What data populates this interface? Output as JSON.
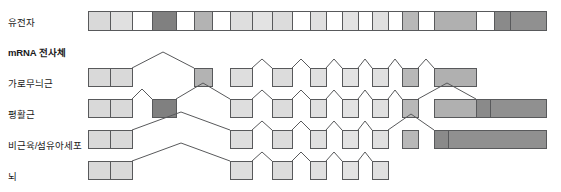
{
  "figure": {
    "title": "",
    "type": "gene-alternative-splicing-diagram",
    "width": 561,
    "height": 192,
    "background": "#ffffff",
    "stroke_color": "#58595b",
    "colors": {
      "light_gray": "#d9d9d9",
      "mid_gray": "#b3b3b3",
      "dark_gray": "#808080",
      "darker_gray": "#6e6e6e",
      "white": "#ffffff",
      "outline": "#58595b",
      "text": "#1a1a1a"
    }
  },
  "labels": [
    {
      "id": "gene",
      "text": "유전자",
      "bold": false,
      "x": 8,
      "y": 18
    },
    {
      "id": "mrna",
      "text": "mRNA 전사체",
      "bold": true,
      "x": 8,
      "y": 48
    },
    {
      "id": "striated",
      "text": "가로무늬근",
      "bold": false,
      "x": 8,
      "y": 79
    },
    {
      "id": "smooth",
      "text": "평활근",
      "bold": false,
      "x": 8,
      "y": 110
    },
    {
      "id": "nonmuscle",
      "text": "비근육/섬유아세포",
      "bold": false,
      "x": 8,
      "y": 141
    },
    {
      "id": "brain",
      "text": "뇌",
      "bold": false,
      "x": 8,
      "y": 172
    }
  ],
  "chart_data": {
    "type": "diagram",
    "xlabel": "",
    "ylabel": "",
    "legend": [],
    "gene_track": {
      "name": "유전자",
      "x_start": 88,
      "x_end": 546,
      "y": 11,
      "height": 19,
      "segments": [
        {
          "index": 1,
          "x": 88,
          "w": 22,
          "fill": "#d9d9d9"
        },
        {
          "index": 2,
          "x": 110,
          "w": 22,
          "fill": "#e0e0e0"
        },
        {
          "index": 3,
          "x": 132,
          "w": 20,
          "fill": "#ffffff"
        },
        {
          "index": 4,
          "x": 152,
          "w": 24,
          "fill": "#808080"
        },
        {
          "index": 5,
          "x": 176,
          "w": 18,
          "fill": "#ffffff"
        },
        {
          "index": 6,
          "x": 194,
          "w": 18,
          "fill": "#b3b3b3"
        },
        {
          "index": 7,
          "x": 212,
          "w": 18,
          "fill": "#ffffff"
        },
        {
          "index": 8,
          "x": 230,
          "w": 22,
          "fill": "#dedede"
        },
        {
          "index": 9,
          "x": 252,
          "w": 20,
          "fill": "#e3e3e3"
        },
        {
          "index": 10,
          "x": 272,
          "w": 20,
          "fill": "#dcdcdc"
        },
        {
          "index": 11,
          "x": 292,
          "w": 18,
          "fill": "#ffffff"
        },
        {
          "index": 12,
          "x": 310,
          "w": 16,
          "fill": "#e0e0e0"
        },
        {
          "index": 13,
          "x": 326,
          "w": 16,
          "fill": "#ffffff"
        },
        {
          "index": 14,
          "x": 342,
          "w": 16,
          "fill": "#e3e3e3"
        },
        {
          "index": 15,
          "x": 358,
          "w": 14,
          "fill": "#ffffff"
        },
        {
          "index": 16,
          "x": 372,
          "w": 16,
          "fill": "#e0e0e0"
        },
        {
          "index": 17,
          "x": 388,
          "w": 14,
          "fill": "#ffffff"
        },
        {
          "index": 18,
          "x": 402,
          "w": 16,
          "fill": "#b8b8b8"
        },
        {
          "index": 19,
          "x": 418,
          "w": 16,
          "fill": "#ffffff"
        },
        {
          "index": 20,
          "x": 434,
          "w": 42,
          "fill": "#b0b0b0"
        },
        {
          "index": 21,
          "x": 476,
          "w": 18,
          "fill": "#ffffff"
        },
        {
          "index": 22,
          "x": 494,
          "w": 16,
          "fill": "#8a8a8a"
        },
        {
          "index": 23,
          "x": 510,
          "w": 36,
          "fill": "#909090"
        }
      ]
    },
    "transcripts": [
      {
        "name": "가로무늬근",
        "baseline_y": 86,
        "box_height": 18,
        "exons": [
          {
            "x": 88,
            "w": 22,
            "fill": "#d9d9d9"
          },
          {
            "x": 110,
            "w": 22,
            "fill": "#d9d9d9"
          },
          {
            "x": 194,
            "w": 18,
            "fill": "#b3b3b3"
          },
          {
            "x": 230,
            "w": 22,
            "fill": "#dedede"
          },
          {
            "x": 272,
            "w": 20,
            "fill": "#dcdcdc"
          },
          {
            "x": 310,
            "w": 16,
            "fill": "#e0e0e0"
          },
          {
            "x": 342,
            "w": 16,
            "fill": "#e3e3e3"
          },
          {
            "x": 372,
            "w": 16,
            "fill": "#e0e0e0"
          },
          {
            "x": 402,
            "w": 16,
            "fill": "#b8b8b8"
          },
          {
            "x": 434,
            "w": 42,
            "fill": "#b0b0b0"
          }
        ],
        "splice_peaks": [
          {
            "from": 132,
            "to": 194,
            "apex_y": -16
          },
          {
            "from": 252,
            "to": 272,
            "apex_y": -9
          },
          {
            "from": 292,
            "to": 310,
            "apex_y": -9
          },
          {
            "from": 326,
            "to": 342,
            "apex_y": -9
          },
          {
            "from": 358,
            "to": 372,
            "apex_y": -9
          },
          {
            "from": 388,
            "to": 402,
            "apex_y": -9
          },
          {
            "from": 418,
            "to": 434,
            "apex_y": -9
          }
        ]
      },
      {
        "name": "평활근",
        "baseline_y": 117,
        "box_height": 18,
        "exons": [
          {
            "x": 88,
            "w": 22,
            "fill": "#d9d9d9"
          },
          {
            "x": 110,
            "w": 22,
            "fill": "#d9d9d9"
          },
          {
            "x": 152,
            "w": 24,
            "fill": "#808080"
          },
          {
            "x": 230,
            "w": 22,
            "fill": "#dedede"
          },
          {
            "x": 272,
            "w": 20,
            "fill": "#dcdcdc"
          },
          {
            "x": 310,
            "w": 16,
            "fill": "#e0e0e0"
          },
          {
            "x": 342,
            "w": 16,
            "fill": "#e3e3e3"
          },
          {
            "x": 372,
            "w": 16,
            "fill": "#e0e0e0"
          },
          {
            "x": 402,
            "w": 16,
            "fill": "#b8b8b8"
          },
          {
            "x": 434,
            "w": 42,
            "fill": "#b0b0b0"
          },
          {
            "x": 476,
            "w": 14,
            "fill": "#8a8a8a"
          },
          {
            "x": 490,
            "w": 56,
            "fill": "#909090"
          }
        ],
        "splice_peaks": [
          {
            "from": 132,
            "to": 152,
            "apex_y": -10
          },
          {
            "from": 176,
            "to": 230,
            "apex_y": -16
          },
          {
            "from": 252,
            "to": 272,
            "apex_y": -9
          },
          {
            "from": 292,
            "to": 310,
            "apex_y": -9
          },
          {
            "from": 326,
            "to": 342,
            "apex_y": -9
          },
          {
            "from": 358,
            "to": 372,
            "apex_y": -9
          },
          {
            "from": 388,
            "to": 402,
            "apex_y": -9
          },
          {
            "from": 418,
            "to": 476,
            "apex_y": -16
          }
        ]
      },
      {
        "name": "비근육/섬유아세포",
        "baseline_y": 148,
        "box_height": 18,
        "exons": [
          {
            "x": 88,
            "w": 22,
            "fill": "#d9d9d9"
          },
          {
            "x": 110,
            "w": 22,
            "fill": "#d9d9d9"
          },
          {
            "x": 230,
            "w": 22,
            "fill": "#dedede"
          },
          {
            "x": 272,
            "w": 20,
            "fill": "#dcdcdc"
          },
          {
            "x": 310,
            "w": 16,
            "fill": "#e0e0e0"
          },
          {
            "x": 342,
            "w": 16,
            "fill": "#e3e3e3"
          },
          {
            "x": 372,
            "w": 16,
            "fill": "#e0e0e0"
          },
          {
            "x": 402,
            "w": 16,
            "fill": "#b8b8b8"
          },
          {
            "x": 434,
            "w": 14,
            "fill": "#8a8a8a"
          },
          {
            "x": 448,
            "w": 98,
            "fill": "#909090"
          }
        ],
        "splice_peaks": [
          {
            "from": 132,
            "to": 230,
            "apex_y": -18
          },
          {
            "from": 252,
            "to": 272,
            "apex_y": -9
          },
          {
            "from": 292,
            "to": 310,
            "apex_y": -9
          },
          {
            "from": 326,
            "to": 342,
            "apex_y": -9
          },
          {
            "from": 358,
            "to": 372,
            "apex_y": -9
          },
          {
            "from": 388,
            "to": 434,
            "apex_y": -16
          }
        ]
      },
      {
        "name": "뇌",
        "baseline_y": 179,
        "box_height": 18,
        "exons": [
          {
            "x": 88,
            "w": 22,
            "fill": "#d9d9d9"
          },
          {
            "x": 110,
            "w": 22,
            "fill": "#d9d9d9"
          },
          {
            "x": 230,
            "w": 22,
            "fill": "#dedede"
          },
          {
            "x": 272,
            "w": 20,
            "fill": "#dcdcdc"
          },
          {
            "x": 310,
            "w": 16,
            "fill": "#e0e0e0"
          },
          {
            "x": 342,
            "w": 16,
            "fill": "#e3e3e3"
          },
          {
            "x": 372,
            "w": 16,
            "fill": "#e0e0e0"
          }
        ],
        "splice_peaks": [
          {
            "from": 132,
            "to": 230,
            "apex_y": -18
          },
          {
            "from": 252,
            "to": 272,
            "apex_y": -9
          },
          {
            "from": 292,
            "to": 310,
            "apex_y": -9
          },
          {
            "from": 326,
            "to": 342,
            "apex_y": -9
          },
          {
            "from": 358,
            "to": 372,
            "apex_y": -9
          }
        ]
      }
    ]
  }
}
